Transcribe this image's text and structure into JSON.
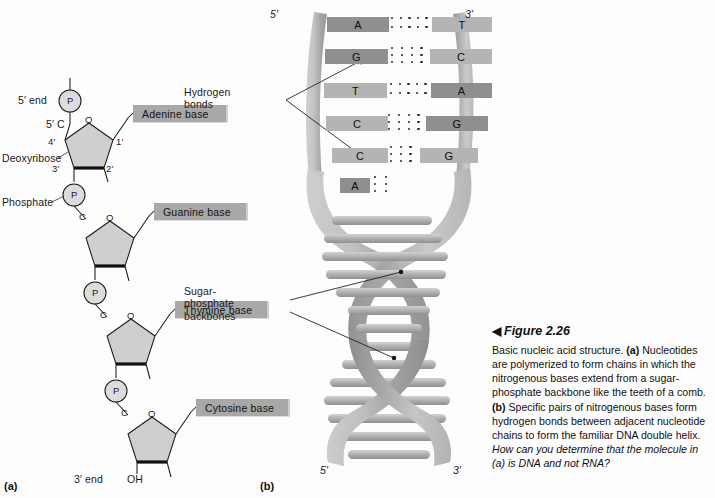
{
  "figure": {
    "title": "Figure 2.26",
    "title_marker": "◀",
    "caption_part1": "Basic nucleic acid structure. ",
    "caption_a_tag": "(a)",
    "caption_part2": " Nucleotides are polymerized to form chains in which the nitrogenous bases extend from a sugar-phosphate backbone like the teeth of a comb. ",
    "caption_b_tag": "(b)",
    "caption_part3": " Specific pairs of nitrogenous bases form hydrogen bonds between adjacent nucleotide chains to form the familiar DNA double helix. ",
    "caption_question": "How can you determine that the molecule in (a) is DNA and not RNA?"
  },
  "panel_a": {
    "tag": "(a)",
    "five_prime_end": "5′ end",
    "three_prime_end": "3′ end",
    "hydroxyl": "OH",
    "deoxyribose_label": "Deoxyribose",
    "phosphate_label": "Phosphate",
    "phosphate_symbol": "P",
    "carbon_symbol": "C",
    "oxygen_symbol": "O",
    "carbon_5_prime": "5′ C",
    "ring_positions": [
      "1′",
      "2′",
      "3′",
      "4′"
    ],
    "bases": [
      {
        "label": "Adenine base"
      },
      {
        "label": "Guanine base"
      },
      {
        "label": "Thymine base"
      },
      {
        "label": "Cytosine base"
      }
    ]
  },
  "panel_b": {
    "tag": "(b)",
    "hydrogen_bonds_label": "Hydrogen bonds",
    "backbone_label": "Sugar-phosphate backbones",
    "top_left_end": "5′",
    "top_right_end": "3′",
    "bottom_left_end": "5′",
    "bottom_right_end": "3′",
    "base_pairs": [
      {
        "left": "A",
        "right": "T",
        "bonds": 2,
        "bond_cols": 5
      },
      {
        "left": "G",
        "right": "C",
        "bonds": 3,
        "bond_cols": 4
      },
      {
        "left": "T",
        "right": "A",
        "bonds": 2,
        "bond_cols": 5
      },
      {
        "left": "C",
        "right": "G",
        "bonds": 3,
        "bond_cols": 4
      },
      {
        "left": "C",
        "right": "G",
        "bonds": 3,
        "bond_cols": 3
      },
      {
        "left": "A",
        "right": "",
        "bonds": 3,
        "bond_cols": 2
      }
    ]
  },
  "colors": {
    "base_box_fill": "#a8a8a8",
    "nucleobase_light": "#b4b4b4",
    "nucleobase_dark": "#8f8f8f",
    "sugar_fill": "#cfcfcf",
    "phosphate_fill": "#d6d6d6",
    "helix_gray": "#b0b0b0",
    "line": "#1a1a1a"
  }
}
